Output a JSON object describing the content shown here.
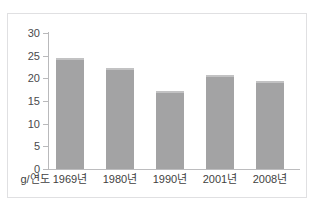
{
  "top_caption": {
    "text": "​ ​ ​ ​ ​ ​ ​ ​ ​ ​ ​ ​"
  },
  "chart_data": {
    "type": "bar",
    "title": "",
    "subtitle": "",
    "xlabel": "",
    "ylabel": "",
    "unit_label": "g/연도",
    "categories": [
      "1969년",
      "1980년",
      "1990년",
      "2001년",
      "2008년"
    ],
    "values": [
      24.5,
      22.3,
      17.2,
      20.7,
      19.5
    ],
    "ylim": [
      0,
      30
    ],
    "yticks": [
      0,
      5,
      10,
      15,
      20,
      25,
      30
    ],
    "ytick_labels": [
      "0",
      "5",
      "10",
      "15",
      "20",
      "25",
      "30"
    ],
    "grid": false,
    "legend": false,
    "legend_position": "none",
    "bar_color": "#a3a3a4",
    "axis_color": "#b9b9bb",
    "frame_color": "#e0e0e2",
    "text_color": "#3f3f41",
    "background": "#ffffff"
  }
}
